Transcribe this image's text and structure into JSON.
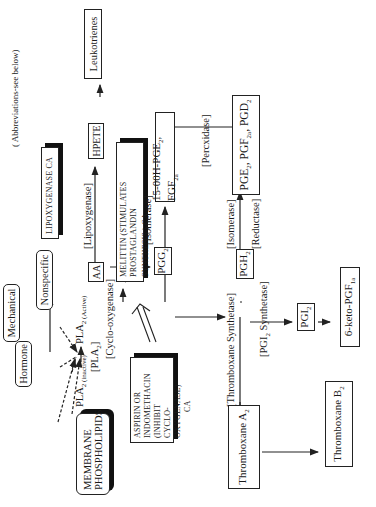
{
  "diagram": {
    "abbrev_note": "( Abbreviations-see below)",
    "nodes": {
      "membrane": "MEMBRANE PHOSPHOLIPIDS",
      "hormone": "Hormone",
      "mechanical": "Mechanical",
      "nonspecific": "Nonspecific",
      "pla2_inactive": "PLA",
      "pla2_inactive_sub": "2 (inactive)",
      "pla2_active": "PLA",
      "pla2_active_sub": "2 (Active)",
      "pla2_bracket": "[PLA",
      "pla2_bracket_sub": "2",
      "pla2_bracket_end": "]",
      "aa": "AA",
      "hpete": "HPETE",
      "leukotrienes": "Leukotrienes",
      "pgg2": "PGG",
      "pgg2_sub": "2",
      "pgh2": "PGH",
      "pgh2_sub": "2",
      "hydroperoxy": "15-00H-PGE",
      "hydroperoxy_sub": "2",
      "hydroperoxy_rest": ", FGF",
      "hydroperoxy_rest_sub": "2a",
      "pges_a": "PGE",
      "pges_a_sub": "2",
      "pges_b": ", PGF",
      "pges_b_sub": "2a",
      "pges_c": ", PGD",
      "pges_c_sub": "2",
      "pgi2": "PGI",
      "pgi2_sub": "2",
      "keto": "6-keto-PGF",
      "keto_sub": "1a",
      "txa2": "Thromboxane A",
      "txa2_sub": "2",
      "txb2": "Thromboxane B",
      "txb2_sub": "2"
    },
    "enzymes": {
      "lipoxygenase": "[Lipoxygenase]",
      "cyclooxygenase": "[Cyclo-oxygenase]",
      "isomerase_1": "[Isomerase]",
      "peroxidase": "[Percxidase]",
      "isomerase_2": "[Isomerase]",
      "reductase": "[Reductase]",
      "thromboxane_synthetase": "[Thromboxane Synthetase]",
      "pgi2_synthetase_a": "[PGI",
      "pgi2_synthetase_sub": "2",
      "pgi2_synthetase_b": " Synthetase]"
    },
    "callouts": {
      "lipoxygenase_ca": "LIPOXYGENASE CA",
      "melittin_line1": "MELITTIN (STIMULATES PROSTAGLANDIN",
      "melittin_line2": "SYNTHESIS ) CA",
      "aspirin_line1": "ASPIRIN OR",
      "aspirin_line2": "INDOMETHACIN (INHIBIT",
      "aspirin_line3": "CYCLO-OXYGENASE)",
      "aspirin_line4": "CA"
    }
  }
}
